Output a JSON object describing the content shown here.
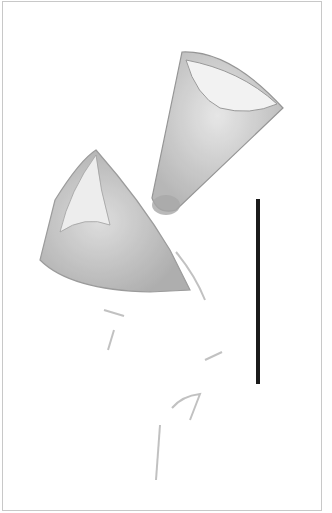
{
  "image": {
    "subject": "two conical loricae under light microscopy",
    "background_color": "#ffffff",
    "specimen_color": "#9a9a9a",
    "scale_bar": {
      "x": 256,
      "y_top": 199,
      "y_bottom": 384,
      "width": 4,
      "color": "#1a1a1a"
    }
  }
}
